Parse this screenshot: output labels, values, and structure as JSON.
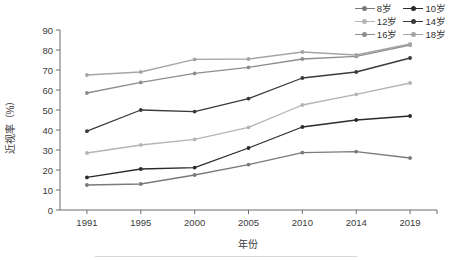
{
  "chart_data": {
    "type": "line",
    "title": "",
    "xlabel": "年份",
    "ylabel": "近视率（%）",
    "categories": [
      "1991",
      "1995",
      "2000",
      "2005",
      "2010",
      "2014",
      "2019"
    ],
    "x": [
      1991,
      1995,
      2000,
      2005,
      2010,
      2014,
      2019
    ],
    "ylim": [
      0,
      90
    ],
    "ytick_step": 10,
    "yticks": [
      "0",
      "10",
      "20",
      "30",
      "40",
      "50",
      "60",
      "70",
      "80",
      "90"
    ],
    "grid": false,
    "legend_position": "top-right",
    "series": [
      {
        "name": "8岁",
        "color": "#7a7a7a",
        "marker": "circle",
        "values": [
          12.5,
          13.0,
          17.5,
          22.7,
          28.7,
          29.2,
          26.0
        ]
      },
      {
        "name": "10岁",
        "color": "#2b2b2b",
        "marker": "circle",
        "values": [
          16.3,
          20.5,
          21.2,
          31.0,
          41.5,
          45.0,
          47.0
        ]
      },
      {
        "name": "12岁",
        "color": "#b4b4b4",
        "marker": "circle",
        "values": [
          28.5,
          32.5,
          35.3,
          41.3,
          52.5,
          57.8,
          63.5
        ]
      },
      {
        "name": "14岁",
        "color": "#3a3a3a",
        "marker": "circle",
        "values": [
          39.4,
          50.0,
          49.2,
          55.7,
          66.0,
          69.0,
          76.0
        ]
      },
      {
        "name": "16岁",
        "color": "#8d8d8d",
        "marker": "circle",
        "values": [
          58.5,
          63.8,
          68.3,
          71.3,
          75.5,
          76.8,
          82.5
        ]
      },
      {
        "name": "18岁",
        "color": "#a5a5a5",
        "marker": "circle",
        "values": [
          67.5,
          69.0,
          75.3,
          75.5,
          79.0,
          77.5,
          83.0
        ]
      }
    ]
  },
  "legend": {
    "entries": [
      {
        "label": "8岁"
      },
      {
        "label": "10岁"
      },
      {
        "label": "12岁"
      },
      {
        "label": "14岁"
      },
      {
        "label": "16岁"
      },
      {
        "label": "18岁"
      }
    ]
  },
  "axes": {
    "x_title": "年份",
    "y_title": "近视率（%）"
  }
}
